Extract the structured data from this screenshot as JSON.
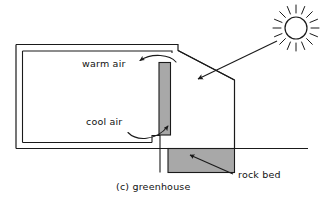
{
  "figure": {
    "caption": "(c) greenhouse",
    "labels": {
      "warm_air": "warm air",
      "cool_air": "cool air",
      "rock_bed": "rock bed"
    },
    "icons": {
      "sun": "sun-icon",
      "sunbeam": "sunbeam-arrow-icon",
      "warm_air_flow": "curved-arrow-left-icon",
      "cool_air_flow": "curved-arrow-up-right-icon",
      "rock_bed_leader": "leader-line-icon"
    },
    "colors": {
      "line": "#1a1a1a",
      "fill_mass": "#a8a8a8",
      "background": "#ffffff",
      "text": "#111111"
    },
    "elements": {
      "structure": "greenhouse-envelope",
      "thermal_mass": "thermal-mass-slab",
      "glazing": "sloped-glazing",
      "ground": "ground-line",
      "rock_storage": "rock-bed-fill"
    }
  }
}
